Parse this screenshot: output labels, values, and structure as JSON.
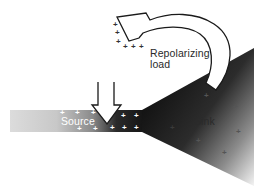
{
  "labels": {
    "repolarizing": "Repolarizing",
    "load": "load",
    "source": "Source",
    "sink": "Sink"
  },
  "colors": {
    "background": "#ffffff",
    "source_light": "#d6d6d6",
    "source_dark": "#1a1a1a",
    "sink_dark": "#111111",
    "sink_light": "#f2f2f2",
    "arrow_fill": "#ffffff",
    "arrow_stroke": "#1a1a1a",
    "charge_on_dark": "#ffffff",
    "charge_on_light": "#333333"
  },
  "charges": {
    "symbol": "+",
    "arrowhead": [
      {
        "x": 113,
        "y": 21
      },
      {
        "x": 115,
        "y": 30
      },
      {
        "x": 117,
        "y": 39
      },
      {
        "x": 123,
        "y": 43
      },
      {
        "x": 131,
        "y": 43
      },
      {
        "x": 139,
        "y": 43
      }
    ],
    "source_bar": [
      {
        "x": 60,
        "y": 109
      },
      {
        "x": 75,
        "y": 109
      },
      {
        "x": 92,
        "y": 109
      },
      {
        "x": 120,
        "y": 112
      },
      {
        "x": 134,
        "y": 112
      },
      {
        "x": 78,
        "y": 125
      },
      {
        "x": 94,
        "y": 125
      },
      {
        "x": 110,
        "y": 124
      },
      {
        "x": 122,
        "y": 124
      },
      {
        "x": 134,
        "y": 124
      }
    ],
    "sink": [
      {
        "x": 204,
        "y": 92
      },
      {
        "x": 233,
        "y": 103
      },
      {
        "x": 236,
        "y": 128
      },
      {
        "x": 196,
        "y": 137
      },
      {
        "x": 222,
        "y": 149
      },
      {
        "x": 170,
        "y": 124
      }
    ]
  }
}
